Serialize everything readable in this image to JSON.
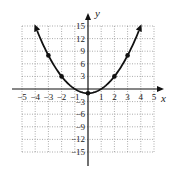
{
  "chart_data": {
    "type": "line",
    "title": "",
    "xlabel": "x",
    "ylabel": "y",
    "xlim": [
      -5,
      5
    ],
    "ylim": [
      -15,
      15
    ],
    "grid": true,
    "grid_style": "dotted",
    "x_ticks": [
      -5,
      -4,
      -3,
      -2,
      -1,
      1,
      2,
      3,
      4,
      5
    ],
    "y_ticks": [
      15,
      12,
      9,
      6,
      3,
      -3,
      -6,
      -9,
      -12,
      -15
    ],
    "x_tick_labels": [
      "−5",
      "−4",
      "−3",
      "−2",
      "−1",
      "1",
      "2",
      "3",
      "4",
      "5"
    ],
    "y_tick_labels": [
      "15",
      "12",
      "9",
      "6",
      "3",
      "−3",
      "−6",
      "−9",
      "−12",
      "−15"
    ],
    "series": [
      {
        "name": "y = x^2 - 1",
        "function": "x^2 - 1",
        "x": [
          -4,
          -3,
          -2,
          -1,
          0,
          1,
          2,
          3,
          4
        ],
        "y": [
          15,
          8,
          3,
          0,
          -1,
          0,
          3,
          8,
          15
        ],
        "marked_points": [
          [
            -3,
            8
          ],
          [
            -2,
            3
          ],
          [
            0,
            -1
          ],
          [
            2,
            3
          ],
          [
            3,
            8
          ]
        ],
        "arrows_at_ends": true
      }
    ],
    "legend": null
  },
  "colors": {
    "curve": "#111111",
    "axes": "#111111",
    "grid": "#888888",
    "background": "#ffffff"
  }
}
